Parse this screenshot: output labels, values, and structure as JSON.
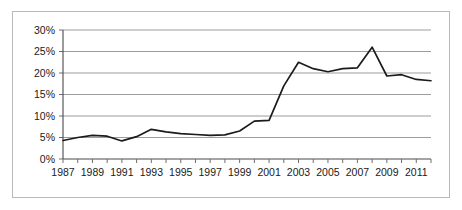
{
  "chart_data": {
    "type": "line",
    "title": "",
    "subtitle": "",
    "xlabel": "",
    "ylabel": "",
    "grid": true,
    "legend": false,
    "legend_position": "none",
    "line_color": "#1b1b1b",
    "gridline_color": "#9c9c9c",
    "axis_color": "#4a4a4a",
    "background_color": "#ffffff",
    "border_color": "#b9b9b9",
    "ylim": [
      0,
      30
    ],
    "ytick_values": [
      0,
      5,
      10,
      15,
      20,
      25,
      30
    ],
    "ytick_labels": [
      "0%",
      "5%",
      "10%",
      "15%",
      "20%",
      "25%",
      "30%"
    ],
    "xlim": [
      1987,
      2012
    ],
    "xtick_labels": [
      "1987",
      "1989",
      "1991",
      "1993",
      "1995",
      "1997",
      "1999",
      "2001",
      "2003",
      "2005",
      "2007",
      "2009",
      "2011"
    ],
    "x": [
      1987,
      1988,
      1989,
      1990,
      1991,
      1992,
      1993,
      1994,
      1995,
      1996,
      1997,
      1998,
      1999,
      2000,
      2001,
      2002,
      2003,
      2004,
      2005,
      2006,
      2007,
      2008,
      2009,
      2010,
      2011,
      2012
    ],
    "values": [
      4.3,
      5.0,
      5.5,
      5.3,
      4.2,
      5.2,
      6.9,
      6.3,
      5.9,
      5.7,
      5.5,
      5.6,
      6.5,
      8.8,
      9.0,
      17.0,
      22.5,
      21.0,
      20.3,
      21.0,
      21.2,
      26.0,
      19.3,
      19.6,
      18.5,
      18.2
    ]
  }
}
